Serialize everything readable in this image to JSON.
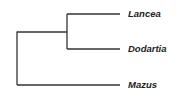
{
  "tree": {
    "title": "Phylogenetic tree",
    "line_color": "#333333",
    "taxa": [
      {
        "name": "Lancea",
        "y": 14
      },
      {
        "name": "Dodartia",
        "y": 49
      },
      {
        "name": "Mazus",
        "y": 85
      }
    ],
    "topology": "((Lancea,Dodartia),Mazus)"
  }
}
